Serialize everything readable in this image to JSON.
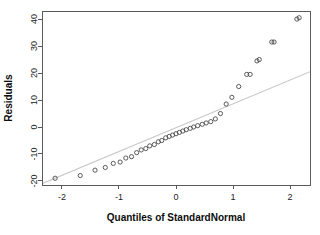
{
  "chart_data": {
    "type": "scatter",
    "title": "",
    "xlabel": "Quantiles of StandardNormal",
    "ylabel": "Residuals",
    "xlim": [
      -2.35,
      2.35
    ],
    "ylim": [
      -21.5,
      43.0
    ],
    "xticks": [
      -2,
      -1,
      0,
      1,
      2
    ],
    "xticklabels": [
      "-2",
      "-1",
      "0",
      "1",
      "2"
    ],
    "yticks": [
      -20,
      -10,
      0,
      10,
      20,
      30,
      40
    ],
    "yticklabels": [
      "-20",
      "-10",
      "0",
      "10",
      "20",
      "30",
      "40"
    ],
    "grid": false,
    "legend": null,
    "series": [
      {
        "name": "residual-quantiles",
        "marker": "open-circle",
        "marker_color": "#4a4a4a",
        "x": [
          -2.12,
          -1.68,
          -1.42,
          -1.24,
          -1.1,
          -0.98,
          -0.88,
          -0.78,
          -0.69,
          -0.61,
          -0.53,
          -0.46,
          -0.38,
          -0.31,
          -0.25,
          -0.18,
          -0.12,
          -0.06,
          0.0,
          0.06,
          0.12,
          0.18,
          0.25,
          0.31,
          0.38,
          0.46,
          0.53,
          0.61,
          0.69,
          0.78,
          0.88,
          0.98,
          1.1,
          1.24,
          1.3,
          1.42,
          1.46,
          1.68,
          1.72,
          2.12,
          2.16
        ],
        "y": [
          -19.0,
          -18.0,
          -16.0,
          -15.0,
          -13.5,
          -13.0,
          -11.5,
          -11.0,
          -9.5,
          -8.5,
          -8.0,
          -7.0,
          -6.5,
          -5.5,
          -5.0,
          -4.0,
          -3.5,
          -3.0,
          -2.5,
          -2.0,
          -1.5,
          -1.0,
          -0.5,
          0.0,
          0.5,
          1.0,
          1.5,
          2.0,
          3.0,
          5.0,
          8.5,
          11.0,
          15.0,
          19.5,
          19.5,
          24.5,
          25.0,
          31.5,
          31.5,
          40.0,
          40.5
        ]
      }
    ],
    "reference_line": {
      "name": "qq-reference-line",
      "color": "#c9c9c9",
      "x": [
        -2.35,
        2.35
      ],
      "y": [
        -21.0,
        20.5
      ]
    }
  }
}
